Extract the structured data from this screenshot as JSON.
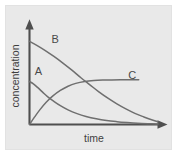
{
  "figure": {
    "background_color": "#ffffff",
    "panel_color": "#e9e9e9",
    "panel_border_color": "#e2e2e2",
    "axis_color": "#4f4f4f",
    "curve_color": "#6f6f6f",
    "label_color": "#3f3f3f"
  },
  "chart_data": {
    "type": "line",
    "title": "",
    "subtitle": "",
    "xlabel": "time",
    "ylabel": "concentration",
    "xticklabels": [],
    "yticklabels": [],
    "grid": false,
    "legend": "inline-curve-labels",
    "axis_style": "arrow-axes",
    "xlim": [
      0,
      1
    ],
    "ylim": [
      0,
      1
    ],
    "annotations": [
      {
        "text": "A",
        "x": 0.07,
        "y": 0.52
      },
      {
        "text": "B",
        "x": 0.2,
        "y": 0.86
      },
      {
        "text": "C",
        "x": 0.8,
        "y": 0.48
      }
    ],
    "series": [
      {
        "name": "A",
        "label": "A",
        "description": "reactant decaying rapidly from a moderate starting concentration toward zero",
        "x": [
          0.0,
          0.03,
          0.06,
          0.1,
          0.14,
          0.19,
          0.24,
          0.3,
          0.37,
          0.44,
          0.52,
          0.6,
          0.68,
          0.76,
          0.84,
          0.92,
          1.0
        ],
        "y": [
          0.455,
          0.43,
          0.395,
          0.345,
          0.295,
          0.245,
          0.2,
          0.155,
          0.115,
          0.085,
          0.06,
          0.042,
          0.03,
          0.021,
          0.014,
          0.009,
          0.005
        ]
      },
      {
        "name": "B",
        "label": "B",
        "description": "reactant decaying slowly from a high starting concentration toward zero",
        "x": [
          0.0,
          0.06,
          0.12,
          0.19,
          0.26,
          0.33,
          0.4,
          0.47,
          0.54,
          0.61,
          0.68,
          0.75,
          0.82,
          0.89,
          0.95,
          1.0
        ],
        "y": [
          0.88,
          0.835,
          0.785,
          0.72,
          0.65,
          0.575,
          0.495,
          0.42,
          0.345,
          0.278,
          0.218,
          0.165,
          0.118,
          0.08,
          0.05,
          0.028
        ]
      },
      {
        "name": "C",
        "label": "C",
        "description": "product rising from zero and levelling off at a plateau",
        "x": [
          0.0,
          0.04,
          0.08,
          0.13,
          0.18,
          0.24,
          0.3,
          0.36,
          0.43,
          0.5,
          0.57,
          0.64,
          0.71,
          0.78,
          0.85
        ],
        "y": [
          0.0,
          0.08,
          0.155,
          0.235,
          0.3,
          0.36,
          0.405,
          0.435,
          0.455,
          0.465,
          0.47,
          0.472,
          0.473,
          0.473,
          0.473
        ]
      }
    ]
  }
}
